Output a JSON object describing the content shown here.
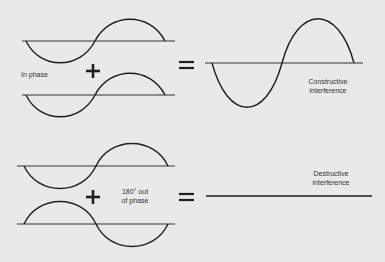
{
  "diagram": {
    "colors": {
      "background": "#e9e9e7",
      "stroke": "#1e1e1e"
    },
    "top_row": {
      "label": "In phase",
      "operator_plus": "+",
      "operator_equals": "=",
      "result_label_line1": "Constructive",
      "result_label_line2": "interference"
    },
    "bottom_row": {
      "label_line1": "180° out",
      "label_line2": "of phase",
      "operator_plus": "+",
      "operator_equals": "=",
      "result_label_line1": "Destructive",
      "result_label_line2": "interference"
    }
  }
}
